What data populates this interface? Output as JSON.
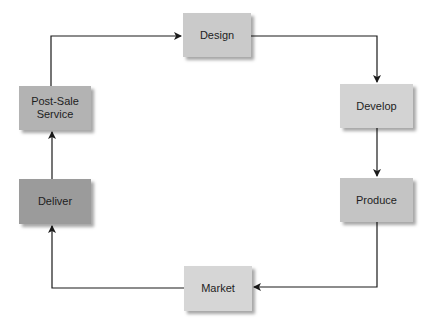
{
  "diagram": {
    "type": "cycle",
    "nodes": [
      {
        "id": "design",
        "label": "Design",
        "color": "#cacaca",
        "x": 183,
        "y": 13,
        "w": 68,
        "h": 44
      },
      {
        "id": "develop",
        "label": "Develop",
        "color": "#d3d3d3",
        "x": 340,
        "y": 84,
        "w": 73,
        "h": 44
      },
      {
        "id": "produce",
        "label": "Produce",
        "color": "#c4c4c4",
        "x": 340,
        "y": 178,
        "w": 73,
        "h": 44
      },
      {
        "id": "market",
        "label": "Market",
        "color": "#d6d6d6",
        "x": 184,
        "y": 266,
        "w": 68,
        "h": 45
      },
      {
        "id": "deliver",
        "label": "Deliver",
        "color": "#9b9b9b",
        "x": 19,
        "y": 179,
        "w": 72,
        "h": 45
      },
      {
        "id": "post-sale-service",
        "label_line1": "Post-Sale",
        "label_line2": "Service",
        "color": "#b3b3b3",
        "x": 19,
        "y": 86,
        "w": 72,
        "h": 44
      }
    ],
    "edges": [
      {
        "from": "design",
        "to": "develop"
      },
      {
        "from": "develop",
        "to": "produce"
      },
      {
        "from": "produce",
        "to": "market"
      },
      {
        "from": "market",
        "to": "deliver"
      },
      {
        "from": "deliver",
        "to": "post-sale-service"
      },
      {
        "from": "post-sale-service",
        "to": "design"
      }
    ],
    "line_color": "#1a1a1a"
  }
}
